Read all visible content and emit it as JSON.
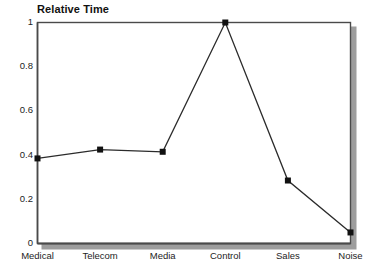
{
  "chart_data": {
    "type": "line",
    "title": "Relative Time",
    "xlabel": "",
    "ylabel": "",
    "categories": [
      "Medical",
      "Telecom",
      "Media",
      "Control",
      "Sales",
      "Noise"
    ],
    "values": [
      0.385,
      0.425,
      0.415,
      1.0,
      0.285,
      0.05
    ],
    "series": [
      {
        "name": "Relative Time",
        "values": [
          0.385,
          0.425,
          0.415,
          1.0,
          0.285,
          0.05
        ]
      }
    ],
    "ylim": [
      0,
      1
    ],
    "ytick_labels": [
      "1",
      "0.8",
      "0.6",
      "0.4",
      "0.2",
      "0"
    ],
    "ytick_values": [
      1,
      0.8,
      0.6,
      0.4,
      0.2,
      0
    ],
    "grid": true,
    "legend": "none",
    "marker": "filled-square",
    "line_color": "#2b2b2b",
    "marker_color": "#111111",
    "grid_color": "#d9d9d9",
    "frame_color": "#4a4a4a",
    "shadow_color": "#8c8c8c",
    "background": "#ffffff"
  }
}
